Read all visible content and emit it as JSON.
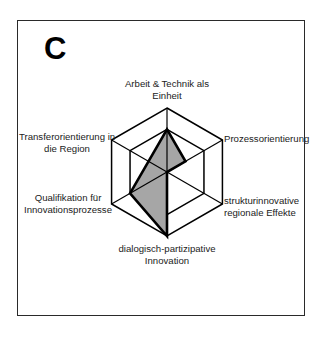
{
  "panel": {
    "letter": "C"
  },
  "chart_data": {
    "type": "radar",
    "title": "C",
    "axes": [
      {
        "label_lines": [
          "Arbeit & Technik als",
          "Einheit"
        ],
        "value": 2
      },
      {
        "label_lines": [
          "Prozessorientierung"
        ],
        "value": 1
      },
      {
        "label_lines": [
          "strukturinnovative",
          "regionale Effekte"
        ],
        "value": 0
      },
      {
        "label_lines": [
          "dialogisch-partizipative",
          "Innovation"
        ],
        "value": 3
      },
      {
        "label_lines": [
          "Qualifikation für",
          "Innovationsprozesse"
        ],
        "value": 2
      },
      {
        "label_lines": [
          "Transferorientierung in",
          "die Region"
        ],
        "value": 1
      }
    ],
    "range": [
      0,
      3
    ],
    "grid_rings": [
      2,
      3
    ],
    "fill_color": "#a6a6a6",
    "line_color": "#000000",
    "grid": true,
    "legend": "none"
  },
  "labels": {
    "a0l0": "Arbeit & Technik als",
    "a0l1": "Einheit",
    "a1l0": "Prozessorientierung",
    "a2l0": "strukturinnovative",
    "a2l1": "regionale Effekte",
    "a3l0": "dialogisch-partizipative",
    "a3l1": "Innovation",
    "a4l0": "Qualifikation für",
    "a4l1": "Innovationsprozesse",
    "a5l0": "Transferorientierung in",
    "a5l1": "die Region"
  }
}
